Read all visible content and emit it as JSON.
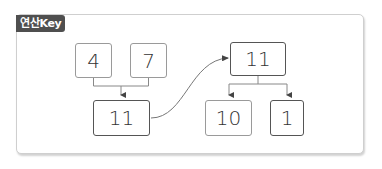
{
  "header": {
    "label": "연산Key"
  },
  "diagram": {
    "operands": [
      {
        "value": "4"
      },
      {
        "value": "7"
      }
    ],
    "sum": {
      "value": "11"
    },
    "split_source": {
      "value": "11"
    },
    "split_parts": [
      {
        "value": "10"
      },
      {
        "value": "1"
      }
    ]
  },
  "colors": {
    "label_bg": "#4f4f4f",
    "light_border": "#9a9a9a",
    "dark_border": "#555555",
    "line": "#777777"
  }
}
